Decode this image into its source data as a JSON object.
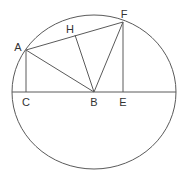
{
  "diagram": {
    "type": "geometry",
    "stroke_color": "#5a5a5a",
    "label_color": "#333333",
    "circle": {
      "cx": 94,
      "cy": 92,
      "rx": 82,
      "ry": 77
    },
    "points": {
      "A": {
        "x": 26,
        "y": 50,
        "label": "A",
        "lx": 18,
        "ly": 51
      },
      "H": {
        "x": 75,
        "y": 35,
        "label": "H",
        "lx": 70,
        "ly": 33
      },
      "F": {
        "x": 123,
        "y": 22,
        "label": "F",
        "lx": 124,
        "ly": 18
      },
      "C": {
        "x": 26,
        "y": 92,
        "label": "C",
        "lx": 26,
        "ly": 106
      },
      "B": {
        "x": 94,
        "y": 92,
        "label": "B",
        "lx": 94,
        "ly": 106
      },
      "E": {
        "x": 123,
        "y": 92,
        "label": "E",
        "lx": 123,
        "ly": 106
      }
    },
    "diameter": {
      "x1": 12,
      "y1": 92,
      "x2": 176,
      "y2": 92
    },
    "segments": [
      {
        "from": "A",
        "to": "F"
      },
      {
        "from": "A",
        "to": "C"
      },
      {
        "from": "A",
        "to": "B"
      },
      {
        "from": "H",
        "to": "B"
      },
      {
        "from": "F",
        "to": "B"
      },
      {
        "from": "F",
        "to": "E"
      }
    ],
    "labels": [
      "A",
      "H",
      "F",
      "C",
      "B",
      "E"
    ]
  }
}
